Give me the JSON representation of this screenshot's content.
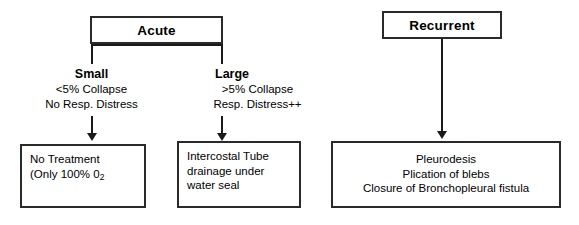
{
  "diagram": {
    "colors": {
      "background": "#ffffff",
      "line": "#1a1a1a",
      "box_border": "#2a2a2a",
      "text": "#000000"
    },
    "acute": {
      "label": "Acute",
      "branches": [
        {
          "id": "small",
          "title": "Small",
          "criteria": [
            "<5% Collapse",
            "No Resp. Distress"
          ],
          "treatment": {
            "lines": [
              "No Treatment",
              "(Only 100% 0"
            ],
            "subscript": "2",
            "line1": "No Treatment",
            "line2_prefix": "(Only 100% 0",
            "line2_sub": "2"
          }
        },
        {
          "id": "large",
          "title": "Large",
          "criteria": [
            ">5% Collapse",
            "Resp. Distress++"
          ],
          "treatment": {
            "lines": [
              "Intercostal Tube",
              "drainage under",
              "water seal"
            ],
            "line1": "Intercostal Tube",
            "line2": "drainage under",
            "line3": "water seal"
          }
        }
      ]
    },
    "recurrent": {
      "label": "Recurrent",
      "treatment": {
        "lines": [
          "Pleurodesis",
          "Plication of blebs",
          "Closure of Bronchopleural fistula"
        ],
        "line1": "Pleurodesis",
        "line2": "Plication of blebs",
        "line3": "Closure of Bronchopleural fistula"
      }
    }
  }
}
